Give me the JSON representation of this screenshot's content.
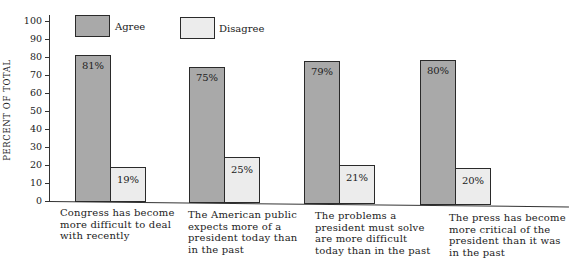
{
  "chart_data": {
    "type": "bar",
    "title": "",
    "xlabel": "",
    "ylabel": "PERCENT OF TOTAL",
    "ylim": [
      0,
      100
    ],
    "yticks": [
      0,
      10,
      20,
      30,
      40,
      50,
      60,
      70,
      80,
      90,
      100
    ],
    "grid": false,
    "legend_position": "top",
    "categories": [
      "Congress has become more difficult to deal with recently",
      "The American public expects more of a president today than in the past",
      "The problems a president must solve are more difficult today than in the past",
      "The press has become more critical of the president than it was in the past"
    ],
    "series": [
      {
        "name": "Agree",
        "color": "#a9a9a9",
        "values": [
          81,
          75,
          79,
          80
        ],
        "labels": [
          "81%",
          "75%",
          "79%",
          "80%"
        ]
      },
      {
        "name": "Disagree",
        "color": "#ececec",
        "values": [
          19,
          25,
          21,
          20
        ],
        "labels": [
          "19%",
          "25%",
          "21%",
          "20%"
        ]
      }
    ]
  },
  "legend": {
    "agree": "Agree",
    "disagree": "Disagree"
  },
  "axis": {
    "ylabel": "PERCENT OF TOTAL",
    "ticks": [
      "0",
      "10",
      "20",
      "30",
      "40",
      "50",
      "60",
      "70",
      "80",
      "90",
      "100"
    ]
  },
  "category_lines": [
    [
      "Congress has become",
      "more difficult to deal",
      "with recently"
    ],
    [
      "The American public",
      "expects more of a",
      "president today than",
      "in the past"
    ],
    [
      "The problems a",
      "president must solve",
      "are more difficult",
      "today than in the past"
    ],
    [
      "The press has become",
      "more critical of the",
      "president than it was",
      "in the past"
    ]
  ]
}
